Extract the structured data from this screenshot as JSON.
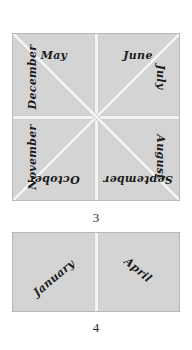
{
  "figures": [
    {
      "id": "figure-3",
      "caption": "3",
      "shape": "square",
      "sectors": 8,
      "labels": {
        "may": "May",
        "june": "June",
        "july": "July",
        "august": "August",
        "september": "September",
        "october": "October",
        "november": "November",
        "december": "December"
      }
    },
    {
      "id": "figure-4",
      "caption": "4",
      "shape": "square",
      "sectors": 2,
      "labels": {
        "january": "January",
        "april": "April"
      }
    }
  ],
  "colors": {
    "fill": "#d4d4d4",
    "border": "#b9b9b9",
    "divider": "#f4f4f4",
    "text": "#1b1b1b",
    "background": "#ffffff"
  }
}
